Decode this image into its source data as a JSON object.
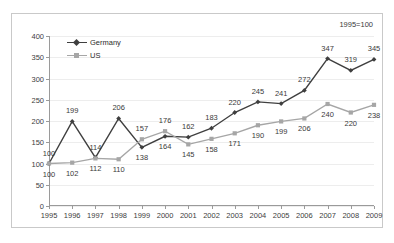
{
  "annotation": {
    "index_note": "1995=100"
  },
  "legend": {
    "position": "top-left-inside",
    "entries": [
      {
        "label": "Germany",
        "color": "#3f3f3f",
        "marker": "diamond"
      },
      {
        "label": "US",
        "color": "#a6a6a6",
        "marker": "square"
      }
    ]
  },
  "chart_data": {
    "type": "line",
    "title": "",
    "subtitle": "",
    "xlabel": "",
    "ylabel": "",
    "annotations": [
      "1995=100"
    ],
    "categories": [
      "1995",
      "1996",
      "1997",
      "1998",
      "1999",
      "2000",
      "2001",
      "2002",
      "2003",
      "2004",
      "2005",
      "2006",
      "2007",
      "2008",
      "2009"
    ],
    "xlim": [
      1995,
      2009
    ],
    "ylim": [
      0,
      400
    ],
    "yticks": [
      0,
      50,
      100,
      150,
      200,
      250,
      300,
      350,
      400
    ],
    "grid": "horizontal",
    "data_labels": true,
    "series": [
      {
        "name": "Germany",
        "color": "#3f3f3f",
        "marker": "diamond",
        "values": [
          100,
          199,
          114,
          206,
          138,
          164,
          162,
          183,
          220,
          245,
          241,
          272,
          347,
          319,
          345
        ]
      },
      {
        "name": "US",
        "color": "#a6a6a6",
        "marker": "square",
        "values": [
          100,
          102,
          112,
          110,
          157,
          176,
          145,
          158,
          171,
          190,
          199,
          206,
          240,
          220,
          238
        ]
      }
    ]
  }
}
